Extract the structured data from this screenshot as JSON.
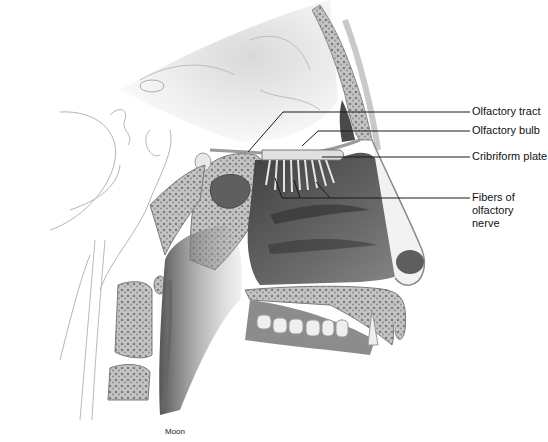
{
  "figure": {
    "labels": [
      {
        "id": "olfactory-tract",
        "text": "Olfactory tract",
        "x": 472,
        "y": 105
      },
      {
        "id": "olfactory-bulb",
        "text": "Olfactory bulb",
        "x": 472,
        "y": 124
      },
      {
        "id": "cribriform-plate",
        "text": "Cribriform plate",
        "x": 472,
        "y": 150
      },
      {
        "id": "fibers-olfactory-nerve",
        "text": "Fibers of\nolfactory\nnerve",
        "x": 472,
        "y": 191
      }
    ],
    "credit": "Moon",
    "colors": {
      "line": "#1a1a1a",
      "bone_fill": "#bdbdbd",
      "cavity_dark": "#5a5a5a",
      "soft_tissue": "#e6e6e6",
      "outline": "#9a9a9a"
    }
  }
}
